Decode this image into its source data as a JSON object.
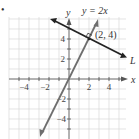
{
  "figure": {
    "bullet": "•",
    "axes": {
      "x_label": "x",
      "y_label": "y",
      "x_ticks": [
        {
          "value": -4,
          "label": "−4"
        },
        {
          "value": -2,
          "label": "−2"
        },
        {
          "value": 2,
          "label": "2"
        },
        {
          "value": 4,
          "label": "4"
        }
      ],
      "y_ticks": [
        {
          "value": 4,
          "label": "4"
        },
        {
          "value": 2,
          "label": "2"
        },
        {
          "value": -2,
          "label": "−2"
        },
        {
          "value": -4,
          "label": "−4"
        }
      ],
      "x_range": [
        -6,
        5.5
      ],
      "y_range": [
        -6,
        6
      ],
      "grid": true
    },
    "lines": [
      {
        "name": "y = 2x",
        "label": "y = 2x",
        "slope": 2,
        "intercept": 0,
        "color": "#6e6e6e"
      },
      {
        "name": "L",
        "label": "L",
        "slope": -0.5,
        "intercept": 5,
        "color": "#222222"
      }
    ],
    "point": {
      "x": 2,
      "y": 4,
      "label": "(2, 4)"
    },
    "right_angle_marker": true
  }
}
